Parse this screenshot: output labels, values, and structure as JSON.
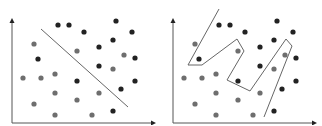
{
  "colors": {
    "background": "#ffffff",
    "axis": "#555555",
    "boundary": "#666666",
    "class_a": "#222222",
    "class_b": "#6e6e6e"
  },
  "panels": [
    {
      "name": "linear-boundary",
      "offset_x": 0,
      "boundary_type": "line",
      "boundary_points": [
        [
          41,
          29
        ],
        [
          128,
          107
        ]
      ]
    },
    {
      "name": "overfit-boundary",
      "offset_x": 161,
      "boundary_type": "polyline",
      "boundary_points": [
        [
          58,
          9
        ],
        [
          27,
          65
        ],
        [
          41,
          65
        ],
        [
          76,
          39
        ],
        [
          83,
          51
        ],
        [
          66,
          80
        ],
        [
          89,
          91
        ],
        [
          125,
          39
        ],
        [
          131,
          46
        ],
        [
          103,
          117
        ]
      ]
    }
  ],
  "axes": {
    "origin": [
      12,
      123
    ],
    "y_top": 18,
    "x_right": 156
  },
  "points": {
    "class_a": [
      [
        58,
        25
      ],
      [
        69,
        25
      ],
      [
        84,
        32
      ],
      [
        116,
        21
      ],
      [
        132,
        32
      ],
      [
        113,
        40
      ],
      [
        99,
        47
      ],
      [
        38,
        59
      ],
      [
        135,
        58
      ],
      [
        99,
        66
      ],
      [
        77,
        81
      ],
      [
        135,
        81
      ],
      [
        121,
        89
      ],
      [
        113,
        111
      ]
    ],
    "class_b": [
      [
        34,
        44
      ],
      [
        77,
        51
      ],
      [
        124,
        55
      ],
      [
        113,
        69
      ],
      [
        23,
        78
      ],
      [
        41,
        78
      ],
      [
        55,
        74
      ],
      [
        55,
        93
      ],
      [
        77,
        100
      ],
      [
        99,
        93
      ],
      [
        34,
        104
      ],
      [
        55,
        115
      ],
      [
        92,
        115
      ]
    ]
  }
}
